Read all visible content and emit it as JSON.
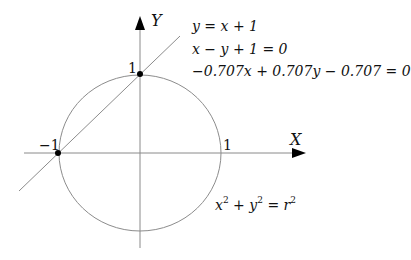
{
  "diagram": {
    "axes": {
      "x_label": "X",
      "y_label": "Y"
    },
    "ticks": {
      "x_pos": "1",
      "x_neg": "−1",
      "y_pos": "1"
    },
    "equations": {
      "line_1": "y = x + 1",
      "line_2": "x − y + 1 = 0",
      "line_3": "−0.707x + 0.707y − 0.707 = 0",
      "circle": "x² + y² = r²"
    },
    "circle_eq_parts": {
      "x": "x",
      "y": "y",
      "r": "r",
      "exp": "2",
      "plus": " + ",
      "equals": " = "
    },
    "points": [
      {
        "label": "(-1, 0)"
      },
      {
        "label": "(0, 1)"
      }
    ],
    "colors": {
      "lines": "#8c8c8c",
      "axis": "#888888",
      "points": "#000000",
      "text": "#111111"
    }
  }
}
